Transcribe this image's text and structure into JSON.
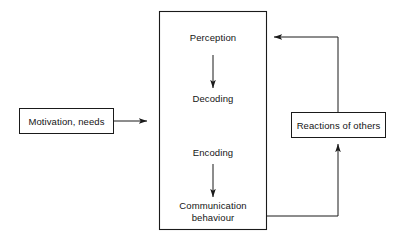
{
  "diagram": {
    "stroke_color": "#1a1a1a",
    "text_color": "#141414",
    "background": "#ffffff",
    "boxes": [
      {
        "id": "motivation",
        "label": "Motivation, needs",
        "x": 19,
        "y": 108,
        "w": 95,
        "h": 26
      },
      {
        "id": "process",
        "label": "",
        "x": 159,
        "y": 11,
        "w": 108,
        "h": 219
      },
      {
        "id": "reactions",
        "label": "Reactions of others",
        "x": 291,
        "y": 112,
        "w": 95,
        "h": 26
      }
    ],
    "stages": [
      {
        "id": "perception",
        "label": "Perception"
      },
      {
        "id": "decoding",
        "label": "Decoding"
      },
      {
        "id": "encoding",
        "label": "Encoding"
      },
      {
        "id": "communication",
        "label": "Communication\nbehaviour",
        "line1": "Communication",
        "line2": "behaviour"
      }
    ],
    "connectors": [
      {
        "id": "motivation-to-process",
        "from": "motivation",
        "to": "process",
        "direction": "right",
        "arrowhead": true
      },
      {
        "id": "perception-to-decoding",
        "from": "perception",
        "to": "decoding",
        "direction": "down",
        "arrowhead": true
      },
      {
        "id": "encoding-to-communication",
        "from": "encoding",
        "to": "communication",
        "direction": "down",
        "arrowhead": true
      },
      {
        "id": "communication-to-reactions",
        "from": "communication",
        "to": "reactions",
        "direction": "up",
        "arrowhead": true
      },
      {
        "id": "reactions-to-perception",
        "from": "reactions",
        "to": "perception",
        "direction": "left",
        "arrowhead": true
      }
    ]
  }
}
